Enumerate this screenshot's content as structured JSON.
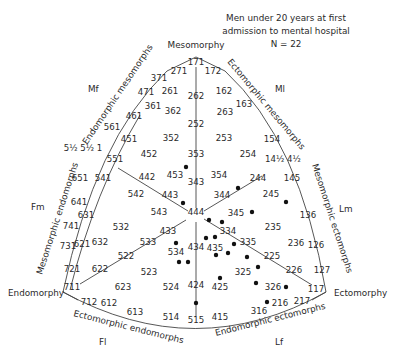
{
  "title": {
    "lines": [
      "Men under 20 years at first",
      "admission to mental hospital",
      "N = 22"
    ]
  },
  "corners": {
    "mesomorphy": "Mesomorphy",
    "endomorphy": "Endomorphy",
    "ectomorphy": "Ectomorphy"
  },
  "sectors": {
    "Mf": "Mf",
    "Ml": "Ml",
    "Fm": "Fm",
    "Lm": "Lm",
    "Fl": "Fl",
    "Lf": "Lf"
  },
  "arc_labels": {
    "endomorphic_mesomorphs": "Endomorphic mesomorphs",
    "ectomorphic_mesomorphs": "Ectomorphic mesomorphs",
    "mesomorphic_endomorphs": "Mesomorphic endomorphs",
    "mesomorphic_ectomorphs": "Mesomorphic ectomorphs",
    "ectomorphic_endomorphs": "Ectomorphic endomorphs",
    "endomorphic_ectomorphs": "Endomorphic ectomorphs"
  },
  "chart_data": {
    "type": "scatter",
    "title": "Men under 20 years at first admission to mental hospital",
    "subtitle": "N = 22",
    "somatotype_labels": [
      {
        "t": "171",
        "x": 196,
        "y": 65
      },
      {
        "t": "271",
        "x": 179,
        "y": 74
      },
      {
        "t": "172",
        "x": 213,
        "y": 74
      },
      {
        "t": "371",
        "x": 159,
        "y": 81
      },
      {
        "t": "471",
        "x": 146,
        "y": 95
      },
      {
        "t": "261",
        "x": 170,
        "y": 94
      },
      {
        "t": "262",
        "x": 196,
        "y": 99
      },
      {
        "t": "162",
        "x": 224,
        "y": 94
      },
      {
        "t": "163",
        "x": 244,
        "y": 107
      },
      {
        "t": "361",
        "x": 153,
        "y": 109
      },
      {
        "t": "362",
        "x": 173,
        "y": 114
      },
      {
        "t": "263",
        "x": 225,
        "y": 115
      },
      {
        "t": "461",
        "x": 134,
        "y": 119
      },
      {
        "t": "252",
        "x": 196,
        "y": 127
      },
      {
        "t": "561",
        "x": 112,
        "y": 130
      },
      {
        "t": "451",
        "x": 129,
        "y": 142
      },
      {
        "t": "352",
        "x": 171,
        "y": 141
      },
      {
        "t": "253",
        "x": 224,
        "y": 141
      },
      {
        "t": "154",
        "x": 272,
        "y": 142
      },
      {
        "t": "5½ 5½ 1",
        "x": 83,
        "y": 151
      },
      {
        "t": "452",
        "x": 149,
        "y": 157
      },
      {
        "t": "353",
        "x": 196,
        "y": 157
      },
      {
        "t": "254",
        "x": 248,
        "y": 157
      },
      {
        "t": "14½ 4½",
        "x": 283,
        "y": 162
      },
      {
        "t": "551",
        "x": 115,
        "y": 162
      },
      {
        "t": "453",
        "x": 175,
        "y": 178
      },
      {
        "t": "354",
        "x": 219,
        "y": 178
      },
      {
        "t": "442",
        "x": 147,
        "y": 180
      },
      {
        "t": "343",
        "x": 196,
        "y": 185
      },
      {
        "t": "651",
        "x": 80,
        "y": 181
      },
      {
        "t": "541",
        "x": 103,
        "y": 181
      },
      {
        "t": "244",
        "x": 258,
        "y": 181
      },
      {
        "t": "145",
        "x": 292,
        "y": 181
      },
      {
        "t": "542",
        "x": 136,
        "y": 197
      },
      {
        "t": "443",
        "x": 170,
        "y": 198
      },
      {
        "t": "344",
        "x": 222,
        "y": 198
      },
      {
        "t": "245",
        "x": 271,
        "y": 197
      },
      {
        "t": "641",
        "x": 79,
        "y": 205
      },
      {
        "t": "631",
        "x": 86,
        "y": 218
      },
      {
        "t": "543",
        "x": 159,
        "y": 215
      },
      {
        "t": "444",
        "x": 196,
        "y": 215
      },
      {
        "t": "345",
        "x": 236,
        "y": 216
      },
      {
        "t": "136",
        "x": 308,
        "y": 218
      },
      {
        "t": "741",
        "x": 71,
        "y": 229
      },
      {
        "t": "532",
        "x": 121,
        "y": 230
      },
      {
        "t": "433",
        "x": 168,
        "y": 234
      },
      {
        "t": "334",
        "x": 228,
        "y": 234
      },
      {
        "t": "235",
        "x": 273,
        "y": 230
      },
      {
        "t": "731",
        "x": 68,
        "y": 249
      },
      {
        "t": "621",
        "x": 82,
        "y": 247
      },
      {
        "t": "632",
        "x": 100,
        "y": 245
      },
      {
        "t": "533",
        "x": 148,
        "y": 245
      },
      {
        "t": "534",
        "x": 176,
        "y": 255
      },
      {
        "t": "434",
        "x": 196,
        "y": 250
      },
      {
        "t": "435",
        "x": 215,
        "y": 251
      },
      {
        "t": "335",
        "x": 248,
        "y": 245
      },
      {
        "t": "236",
        "x": 296,
        "y": 246
      },
      {
        "t": "126",
        "x": 316,
        "y": 248
      },
      {
        "t": "522",
        "x": 126,
        "y": 259
      },
      {
        "t": "225",
        "x": 272,
        "y": 259
      },
      {
        "t": "721",
        "x": 72,
        "y": 272
      },
      {
        "t": "622",
        "x": 100,
        "y": 272
      },
      {
        "t": "523",
        "x": 149,
        "y": 275
      },
      {
        "t": "325",
        "x": 243,
        "y": 275
      },
      {
        "t": "226",
        "x": 294,
        "y": 273
      },
      {
        "t": "127",
        "x": 322,
        "y": 273
      },
      {
        "t": "711",
        "x": 72,
        "y": 290
      },
      {
        "t": "623",
        "x": 123,
        "y": 290
      },
      {
        "t": "524",
        "x": 171,
        "y": 290
      },
      {
        "t": "424",
        "x": 196,
        "y": 288
      },
      {
        "t": "425",
        "x": 220,
        "y": 290
      },
      {
        "t": "326",
        "x": 273,
        "y": 290
      },
      {
        "t": "117",
        "x": 316,
        "y": 292
      },
      {
        "t": "712",
        "x": 89,
        "y": 305
      },
      {
        "t": "612",
        "x": 109,
        "y": 306
      },
      {
        "t": "613",
        "x": 135,
        "y": 315
      },
      {
        "t": "216",
        "x": 280,
        "y": 306
      },
      {
        "t": "217",
        "x": 302,
        "y": 304
      },
      {
        "t": "514",
        "x": 171,
        "y": 320
      },
      {
        "t": "515",
        "x": 196,
        "y": 323
      },
      {
        "t": "415",
        "x": 220,
        "y": 320
      },
      {
        "t": "316",
        "x": 259,
        "y": 314
      }
    ],
    "points": [
      {
        "x": 186,
        "y": 167
      },
      {
        "x": 238,
        "y": 188
      },
      {
        "x": 183,
        "y": 203
      },
      {
        "x": 209,
        "y": 220
      },
      {
        "x": 222,
        "y": 222
      },
      {
        "x": 252,
        "y": 212
      },
      {
        "x": 286,
        "y": 202
      },
      {
        "x": 206,
        "y": 238
      },
      {
        "x": 215,
        "y": 237
      },
      {
        "x": 176,
        "y": 243
      },
      {
        "x": 179,
        "y": 262
      },
      {
        "x": 188,
        "y": 262
      },
      {
        "x": 216,
        "y": 255
      },
      {
        "x": 228,
        "y": 253
      },
      {
        "x": 234,
        "y": 244
      },
      {
        "x": 247,
        "y": 257
      },
      {
        "x": 258,
        "y": 267
      },
      {
        "x": 256,
        "y": 283
      },
      {
        "x": 220,
        "y": 278
      },
      {
        "x": 196,
        "y": 303
      },
      {
        "x": 267,
        "y": 302
      },
      {
        "x": 286,
        "y": 287
      }
    ],
    "n": 22
  }
}
